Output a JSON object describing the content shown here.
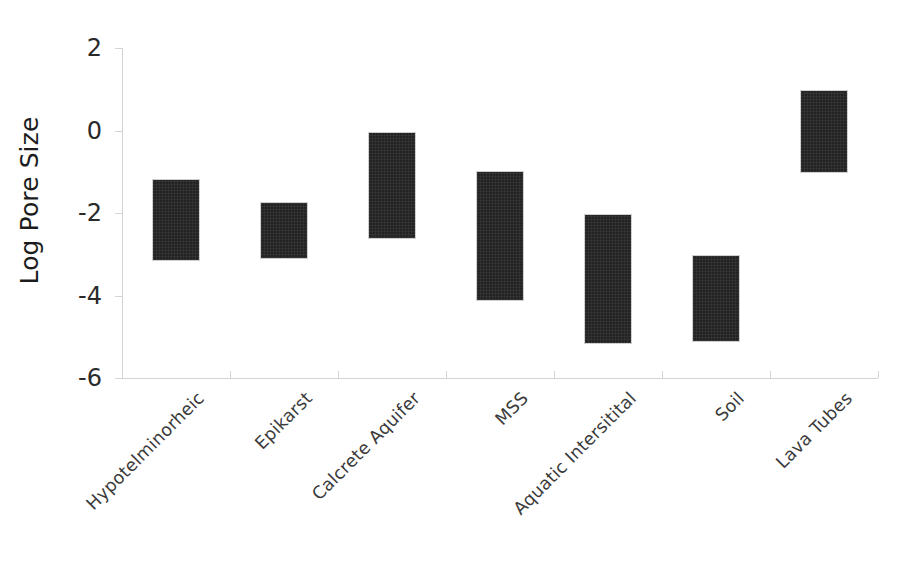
{
  "chart_data": {
    "type": "bar",
    "title": "",
    "xlabel": "",
    "ylabel": "Log Pore Size",
    "ylim": [
      -6,
      2
    ],
    "yticks": [
      2,
      0,
      -2,
      -4,
      -6
    ],
    "ytick_labels": [
      "2",
      "0",
      "-2",
      "-4",
      "-6"
    ],
    "grid": false,
    "legend": null,
    "note": "Floating (range) bars: each bar spans from a low to a high log pore size value.",
    "categories": [
      "Hypotelminorheic",
      "Epikarst",
      "Calcrete Aquifer",
      "MSS",
      "Aquatic Intersitital",
      "Soil",
      "Lava Tubes"
    ],
    "bars": [
      {
        "category": "Hypotelminorheic",
        "low": -3.15,
        "high": -1.2
      },
      {
        "category": "Epikarst",
        "low": -3.1,
        "high": -1.75
      },
      {
        "category": "Calcrete Aquifer",
        "low": -2.6,
        "high": -0.05
      },
      {
        "category": "MSS",
        "low": -4.1,
        "high": -1.0
      },
      {
        "category": "Aquatic Intersitital",
        "low": -5.15,
        "high": -2.05
      },
      {
        "category": "Soil",
        "low": -5.1,
        "high": -3.05
      },
      {
        "category": "Lava Tubes",
        "low": -1.0,
        "high": 0.95
      }
    ],
    "bar_color": "#232323",
    "axis_color": "#d4dbd4",
    "background_color": "#ffffff"
  }
}
